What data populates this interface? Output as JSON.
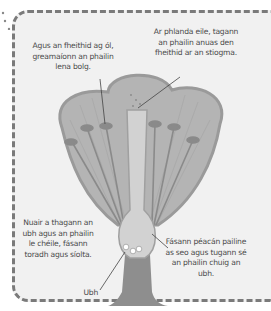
{
  "diagram": {
    "colors": {
      "background": "#f1f1f1",
      "border_dash": "#7a7a7a",
      "petal_fill": "#b4b4b4",
      "petal_stroke": "#9a9a9a",
      "stamen": "#8a8a8a",
      "ovary": "#d2d2d2",
      "stem": "#8e8e8e",
      "text": "#4a4a4a"
    },
    "labels": {
      "top_left": "Agus an fheithid ag ól, greamaíonn an phailin lena bolg.",
      "top_right": "Ar phlanda eile, tagann an phailin anuas den fheithid ar an stiogma.",
      "bottom_left": "Nuair a thagann an ubh agus an phailin le chéile, fásann toradh agus síolta.",
      "bottom_right": "Fásann péacán pailine as seo agus tugann sé an phailin chuig an ubh.",
      "egg": "Ubh"
    }
  }
}
